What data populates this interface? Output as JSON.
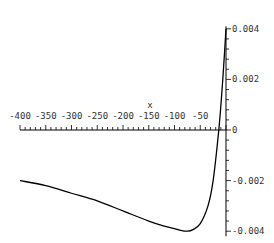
{
  "chart_data": {
    "type": "line",
    "title": "",
    "xlabel": "x",
    "ylabel": "",
    "xlim": [
      -400,
      0
    ],
    "ylim": [
      -0.0042,
      0.0042
    ],
    "x_ticks": [
      "-400",
      "-350",
      "-300",
      "-250",
      "-200",
      "-150",
      "-100",
      "-50"
    ],
    "y_ticks": [
      "0.004",
      "0.002",
      "0",
      "-0.002",
      "-0.004"
    ],
    "grid": false,
    "legend": null,
    "series": [
      {
        "name": "f(x)",
        "x": [
          -400,
          -350,
          -300,
          -250,
          -200,
          -150,
          -120,
          -100,
          -85,
          -76,
          -65,
          -50,
          -35,
          -25,
          -14,
          -8,
          -3,
          0
        ],
        "y": [
          -0.002,
          -0.0022,
          -0.0025,
          -0.0028,
          -0.0032,
          -0.0036,
          -0.0038,
          -0.0039,
          -0.00398,
          -0.004,
          -0.00395,
          -0.0037,
          -0.003,
          -0.002,
          0.0,
          0.0015,
          0.003,
          0.004
        ]
      }
    ]
  }
}
